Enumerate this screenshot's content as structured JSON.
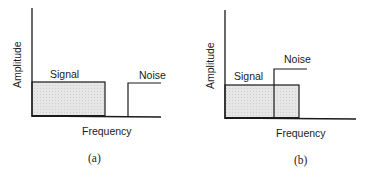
{
  "figure": {
    "panels": [
      {
        "id": "a",
        "caption": "(a)",
        "y_axis_label": "Amplitude",
        "x_axis_label": "Frequency",
        "signal_label": "Signal",
        "noise_label": "Noise",
        "description": "Signal band and noise band separated in frequency (no overlap)"
      },
      {
        "id": "b",
        "caption": "(b)",
        "y_axis_label": "Amplitude",
        "x_axis_label": "Frequency",
        "signal_label": "Signal",
        "noise_label": "Noise",
        "description": "Noise band overlaps the upper portion of the signal band in frequency"
      }
    ],
    "colors": {
      "line": "#1a1a1a",
      "signal_fill": "#e4e4e4",
      "background": "#ffffff"
    }
  }
}
